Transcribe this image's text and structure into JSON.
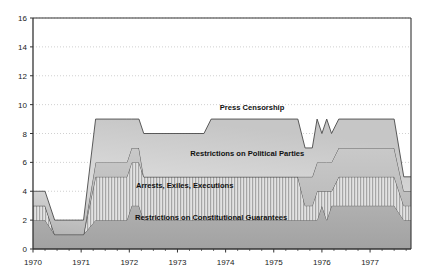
{
  "chart_data": {
    "type": "area",
    "stacked": true,
    "title": "",
    "subtitle": "",
    "xlabel": "",
    "ylabel": "",
    "xlim": [
      1970,
      1977.85
    ],
    "ylim": [
      0,
      16
    ],
    "yticks": [
      0,
      2,
      4,
      6,
      8,
      10,
      12,
      14,
      16
    ],
    "xticks": [
      1970,
      1971,
      1972,
      1973,
      1974,
      1975,
      1976,
      1977
    ],
    "xtick_labels": [
      "1970",
      "1971",
      "1972",
      "1973",
      "1974",
      "1975",
      "1976",
      "1977"
    ],
    "ytick_labels": [
      "0",
      "2",
      "4",
      "6",
      "8",
      "10",
      "12",
      "14",
      "16"
    ],
    "minor_xticks_per_year": 4,
    "grid": "horizontal-dotted",
    "legend_position": "inline-annotations",
    "x": [
      1970.0,
      1970.25,
      1970.45,
      1971.05,
      1971.3,
      1971.95,
      1972.05,
      1972.2,
      1972.3,
      1973.55,
      1973.7,
      1975.5,
      1975.65,
      1975.8,
      1975.9,
      1976.0,
      1976.1,
      1976.2,
      1976.35,
      1977.5,
      1977.7,
      1977.85
    ],
    "series": [
      {
        "name": "Restrictions on Constitutional Guarantees",
        "label": "Restrictions on Constitutional Guarantees",
        "color": "#a8a8a8",
        "pattern": "solid-gray",
        "values": [
          2,
          2,
          1,
          1,
          2,
          2,
          3,
          3,
          2,
          2,
          2,
          2,
          2,
          2,
          2,
          3,
          2,
          3,
          3,
          3,
          2,
          2
        ]
      },
      {
        "name": "Arrests, Exiles, Executions",
        "label": "Arrests, Exiles, Executions",
        "color": "#d0d0d0",
        "pattern": "vertical-hatch",
        "values": [
          1,
          1,
          0,
          0,
          3,
          3,
          3,
          3,
          3,
          3,
          3,
          3,
          1,
          1,
          2,
          1,
          2,
          1,
          2,
          2,
          1,
          1
        ]
      },
      {
        "name": "Restrictions on Political Parties",
        "label": "Restrictions on Political Parties",
        "color": "#bdbdbd",
        "pattern": "solid-light",
        "values": [
          0,
          0,
          0,
          0,
          1,
          1,
          1,
          1,
          0,
          0,
          0,
          0,
          2,
          2,
          2,
          2,
          2,
          2,
          2,
          2,
          1,
          1
        ]
      },
      {
        "name": "Press Censorship",
        "label": "Press Censorship",
        "color": "#c8c8c8",
        "pattern": "gradient-gray",
        "values": [
          1,
          1,
          1,
          1,
          3,
          3,
          2,
          2,
          3,
          3,
          4,
          4,
          2,
          2,
          3,
          2,
          3,
          2,
          2,
          2,
          1,
          1
        ]
      }
    ],
    "annotations": [
      {
        "text": "Press Censorship",
        "x": 1974.55,
        "y": 9.6
      },
      {
        "text": "Restrictions on Political Parties",
        "x": 1974.45,
        "y": 6.45
      },
      {
        "text": "Arrests, Exiles, Executions",
        "x": 1973.15,
        "y": 4.25
      },
      {
        "text": "Restrictions on Constitutional Guarantees",
        "x": 1973.7,
        "y": 2.0
      }
    ]
  },
  "axes": {
    "y_title": "",
    "x_title": ""
  },
  "colors": {
    "axis": "#333333",
    "grid": "#bbbbbb",
    "plot_background": "#ffffff",
    "page_background": "#ffffff",
    "series_stroke": "#4a4a4a"
  }
}
